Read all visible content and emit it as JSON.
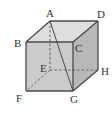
{
  "diagram": {
    "type": "cube",
    "vertices": {
      "A": {
        "label": "A",
        "x": 50,
        "y": 21
      },
      "B": {
        "label": "B",
        "x": 26,
        "y": 42
      },
      "C": {
        "label": "C",
        "x": 73,
        "y": 42
      },
      "D": {
        "label": "D",
        "x": 98,
        "y": 21
      },
      "E": {
        "label": "E",
        "x": 50,
        "y": 70
      },
      "F": {
        "label": "F",
        "x": 26,
        "y": 91
      },
      "G": {
        "label": "G",
        "x": 73,
        "y": 91
      },
      "H": {
        "label": "H",
        "x": 98,
        "y": 70
      }
    },
    "diagonal": "AG",
    "hidden_edges": [
      "AE",
      "EF",
      "EH"
    ],
    "colors": {
      "front_face": "#c8c8c8",
      "top_face": "#dcdcdc",
      "right_face": "#b4b4b4",
      "edge": "#555555"
    }
  }
}
